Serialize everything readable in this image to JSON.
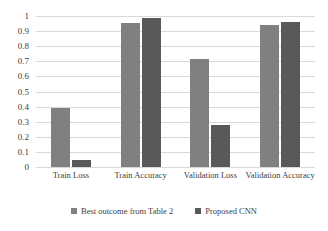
{
  "chart_data": {
    "type": "bar",
    "title": "",
    "xlabel": "",
    "ylabel": "",
    "ylim": [
      0,
      1
    ],
    "grid": true,
    "legend_position": "bottom",
    "categories": [
      "Train Loss",
      "Train Accuracy",
      "Validation Loss",
      "Validation Accuracy"
    ],
    "ytick_labels": [
      "1",
      "0.9",
      "0.8",
      "0.7",
      "0.6",
      "0.5",
      "0.4",
      "0.3",
      "0.2",
      "0.1",
      "0"
    ],
    "ytick_values": [
      1,
      0.9,
      0.8,
      0.7,
      0.6,
      0.5,
      0.4,
      0.3,
      0.2,
      0.1,
      0
    ],
    "series": [
      {
        "name": "Best outcome from Table 2",
        "color": "#808080",
        "values": [
          0.39,
          0.952,
          0.717,
          0.938
        ]
      },
      {
        "name": "Proposed CNN",
        "color": "#595959",
        "values": [
          0.045,
          0.988,
          0.277,
          0.959
        ]
      }
    ]
  },
  "colors": {
    "gridline": "#d9d9d9",
    "text": "#404040",
    "background": "#ffffff"
  }
}
